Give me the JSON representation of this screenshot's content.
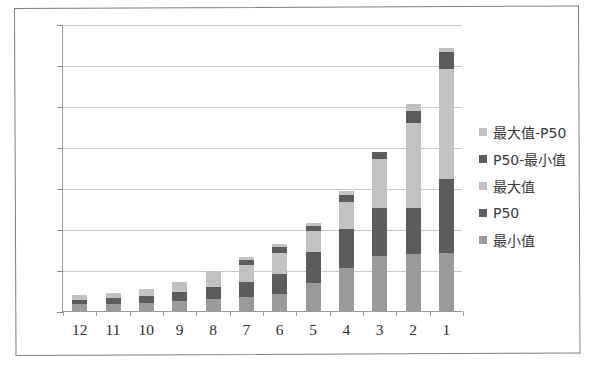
{
  "chart_data": {
    "type": "bar",
    "subtype": "stacked-bar",
    "title": "",
    "xlabel": "",
    "ylabel": "",
    "ylim": [
      0,
      140000
    ],
    "ytick_step": 20000,
    "ytick_labels": [
      "0",
      "20 000",
      "40 000",
      "60 000",
      "80 000",
      "100 000",
      "120 000",
      "140 000"
    ],
    "ytick_values": [
      0,
      20000,
      40000,
      60000,
      80000,
      100000,
      120000,
      140000
    ],
    "grid": true,
    "legend_position": "right",
    "categories": [
      "12",
      "11",
      "10",
      "9",
      "8",
      "7",
      "6",
      "5",
      "4",
      "3",
      "2",
      "1"
    ],
    "series": [
      {
        "name": "最小值",
        "color": "#9a9a9a",
        "values": [
          3200,
          3600,
          4100,
          5000,
          6000,
          6900,
          8200,
          13800,
          20800,
          26800,
          28000,
          28200
        ]
      },
      {
        "name": "P50",
        "color": "#5c5c5c",
        "values": [
          2300,
          2600,
          3200,
          4500,
          5600,
          7200,
          10000,
          14800,
          19400,
          23400,
          22300,
          36000
        ]
      },
      {
        "name": "最大值",
        "color": "#c2c2c2",
        "values": [
          2400,
          2600,
          3300,
          4700,
          6200,
          8200,
          10300,
          10200,
          13200,
          24000,
          41500,
          53800
        ]
      },
      {
        "name": "P50-最小值",
        "color": "#5c5c5c",
        "values": [
          0,
          0,
          0,
          0,
          0,
          2500,
          2600,
          2800,
          3400,
          3600,
          5900,
          8200
        ]
      },
      {
        "name": "最大值-P50",
        "color": "#c2c2c2",
        "values": [
          0,
          0,
          0,
          0,
          1800,
          1500,
          1700,
          1400,
          1700,
          0,
          3300,
          2300
        ]
      }
    ],
    "totals": [
      7900,
      8800,
      10600,
      14200,
      19600,
      26300,
      32800,
      43000,
      58500,
      77800,
      101000,
      128500
    ]
  },
  "legend": {
    "entries": [
      {
        "label": "最大值-P50",
        "color": "#c2c2c2"
      },
      {
        "label": "P50-最小值",
        "color": "#5c5c5c"
      },
      {
        "label": "最大值",
        "color": "#c2c2c2"
      },
      {
        "label": "P50",
        "color": "#5c5c5c"
      },
      {
        "label": "最小值",
        "color": "#9a9a9a"
      }
    ]
  },
  "colors": {
    "plot_background": "#ffffff",
    "gridline": "#c9c9c9",
    "axis": "#9b9b9b",
    "border": "#7d7d7d",
    "text": "#2e2e2e"
  }
}
